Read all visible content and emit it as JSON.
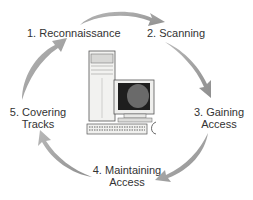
{
  "diagram": {
    "type": "cycle",
    "center_image": "desktop-computer",
    "steps": [
      {
        "number": 1,
        "lines": [
          "1. Reconnaissance"
        ]
      },
      {
        "number": 2,
        "lines": [
          "2. Scanning"
        ]
      },
      {
        "number": 3,
        "lines": [
          "3. Gaining",
          "Access"
        ]
      },
      {
        "number": 4,
        "lines": [
          "4. Maintaining",
          "Access"
        ]
      },
      {
        "number": 5,
        "lines": [
          "5. Covering",
          "Tracks"
        ]
      }
    ],
    "arrows": [
      {
        "from": 1,
        "to": 2
      },
      {
        "from": 2,
        "to": 3
      },
      {
        "from": 3,
        "to": 4
      },
      {
        "from": 4,
        "to": 5
      },
      {
        "from": 5,
        "to": 1
      }
    ],
    "colors": {
      "arrow": "#a8a8a8",
      "arrow_dark": "#8a8a8a",
      "text": "#333333"
    }
  }
}
